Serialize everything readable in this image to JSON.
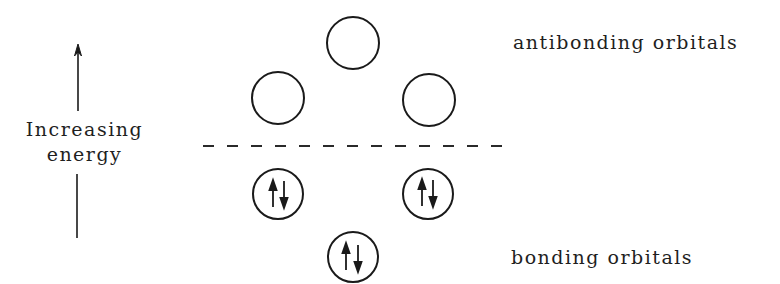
{
  "diagram": {
    "axis": {
      "label_line1": "Increasing",
      "label_line2": "energy",
      "direction": "up"
    },
    "antibonding": {
      "label": "antibonding orbitals",
      "orbitals": [
        {
          "id": "ab1",
          "cx": 353,
          "cy": 43,
          "electrons": ""
        },
        {
          "id": "ab2",
          "cx": 278,
          "cy": 98,
          "electrons": ""
        },
        {
          "id": "ab3",
          "cx": 428,
          "cy": 99,
          "electrons": ""
        }
      ]
    },
    "bonding": {
      "label": "bonding orbitals",
      "orbitals": [
        {
          "id": "b1",
          "cx": 278,
          "cy": 194,
          "electrons": "↑↓"
        },
        {
          "id": "b2",
          "cx": 428,
          "cy": 194,
          "electrons": "↑↓"
        },
        {
          "id": "b3",
          "cx": 353,
          "cy": 257,
          "electrons": "↑↓"
        }
      ]
    },
    "separator": {
      "style": "dashed",
      "y": 146,
      "x1": 203,
      "x2": 515
    },
    "colors": {
      "ink": "#1a1a1a",
      "background": "#ffffff"
    }
  }
}
